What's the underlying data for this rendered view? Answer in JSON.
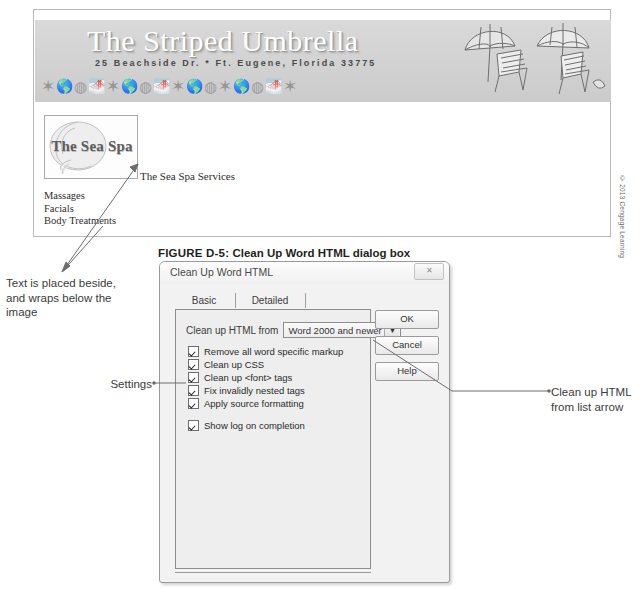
{
  "webpage": {
    "banner": {
      "title": "The Striped Umbrella",
      "address": "25 Beachside Dr. * Ft. Eugene, Florida 33775",
      "shell_icons": [
        "starfish-icon",
        "shell-icon",
        "sanddollar-icon",
        "shell-icon",
        "starfish-icon",
        "shell-icon",
        "sanddollar-icon",
        "shell-icon",
        "starfish-icon",
        "shell-icon",
        "sanddollar-icon",
        "starfish-icon",
        "shell-icon",
        "sanddollar-icon",
        "shell-icon",
        "starfish-icon"
      ],
      "umbrella_art": "beach-umbrella-and-chairs-illustration"
    },
    "sea_spa_image_alt": "The Sea Spa",
    "services_heading": "The Sea Spa Services",
    "services": [
      "Massages",
      "Facials",
      "Body Treatments"
    ]
  },
  "credit": "© 2013 Cengage Learning",
  "figure": {
    "label": "FIGURE D-5:",
    "title": "Clean Up Word HTML dialog box"
  },
  "annotations": {
    "text_placed": "Text is placed beside, and wraps below the image",
    "settings": "Settings",
    "list_arrow": "Clean up HTML from list arrow"
  },
  "dialog": {
    "title": "Clean Up Word HTML",
    "close_label": "✕",
    "tabs": [
      {
        "label": "Basic",
        "selected": true
      },
      {
        "label": "Detailed",
        "selected": false
      }
    ],
    "cleanup_from": {
      "label": "Clean up HTML from",
      "value": "Word 2000 and newer",
      "arrow": "▼"
    },
    "options": [
      {
        "label": "Remove all word specific markup",
        "checked": true
      },
      {
        "label": "Clean up CSS",
        "checked": true
      },
      {
        "label": "Clean up <font> tags",
        "checked": true
      },
      {
        "label": "Fix invalidly nested tags",
        "checked": true
      },
      {
        "label": "Apply source formatting",
        "checked": true
      }
    ],
    "log_option": {
      "label": "Show log on completion",
      "checked": true
    },
    "buttons": [
      {
        "label": "OK"
      },
      {
        "label": "Cancel"
      },
      {
        "label": "Help"
      }
    ]
  },
  "colors": {
    "banner_gray": "#d5d5d5",
    "dialog_face": "#f2f2f2",
    "panel_face": "#eeeeee",
    "text": "#231f20",
    "leader": "#6d6d6d"
  }
}
